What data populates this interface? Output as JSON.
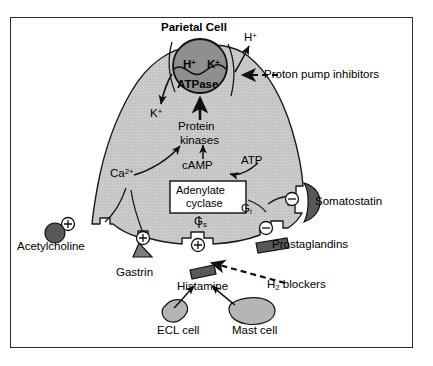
{
  "diagram": {
    "title": "Parietal Cell",
    "frame_color": "#2b2b2b",
    "cell_fill": "#c9c9c9",
    "pump_fill": "#8f8f8f",
    "dark_shape_fill": "#585858",
    "mid_shape_fill": "#7d7d7d",
    "light_cell_fill": "#b5b5b5"
  },
  "pump": {
    "ion_h": "H",
    "ion_h_charge": "+",
    "ion_k": "K",
    "ion_k_charge": "+",
    "enzyme": "ATPase"
  },
  "ions": {
    "h_efflux": "H",
    "h_efflux_charge": "+",
    "k_influx": "K",
    "k_influx_charge": "+",
    "calcium": "Ca",
    "calcium_charge": "2+"
  },
  "intracellular": {
    "protein_kinases_line1": "Protein",
    "protein_kinases_line2": "kinases",
    "camp": "cAMP",
    "atp": "ATP",
    "adenylate_line1": "Adenylate",
    "adenylate_line2": "cyclase",
    "g_stimulatory": "G",
    "g_stimulatory_sub": "s",
    "g_inhibitory": "G",
    "g_inhibitory_sub": "i"
  },
  "ligands": {
    "acetylcholine": "Acetylcholine",
    "gastrin": "Gastrin",
    "histamine": "Histamine",
    "somatostatin": "Somatostatin",
    "prostaglandins": "Prostaglandins"
  },
  "cells": {
    "ecl": "ECL cell",
    "mast": "Mast cell"
  },
  "drugs": {
    "ppi": "Proton pump inhibitors",
    "h2_blockers": "H",
    "h2_blockers_sub": "2",
    "h2_blockers_rest": " blockers"
  },
  "receptors": {
    "plus": "⊕",
    "minus": "⊖",
    "acetylcholine_sign": "plus",
    "gastrin_sign": "plus",
    "histamine_sign": "plus",
    "somatostatin_sign": "minus",
    "prostaglandin_sign": "minus"
  }
}
